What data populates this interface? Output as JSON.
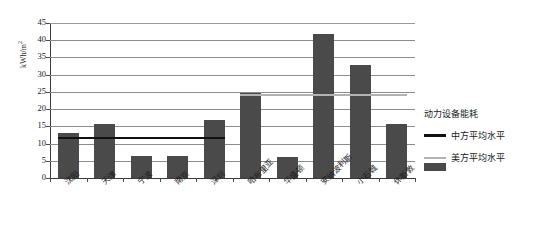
{
  "chart_data": {
    "type": "bar",
    "title": "",
    "xlabel": "",
    "ylabel": "kWh/m",
    "ylabel_sup": "2",
    "ylim": [
      0,
      45
    ],
    "ytick_step": 5,
    "yticks": [
      "45",
      "40",
      "35",
      "30",
      "25",
      "20",
      "15",
      "10",
      "5",
      "0"
    ],
    "grid": true,
    "categories": [
      "沈阳",
      "天津",
      "宁波",
      "南京",
      "深圳",
      "哈布里亚",
      "华盛顿",
      "安纳波利斯",
      "小石城",
      "休斯敦"
    ],
    "series": [
      {
        "name": "动力设备能耗",
        "type": "bar",
        "color": "#4a4a4a",
        "values": [
          13.0,
          15.7,
          6.5,
          6.3,
          16.8,
          24.8,
          6.0,
          41.8,
          32.8,
          15.7
        ]
      },
      {
        "name": "中方平均水平",
        "type": "line",
        "color": "#111111",
        "value": 12.0,
        "span_categories": [
          0,
          4
        ]
      },
      {
        "name": "美方平均水平",
        "type": "line",
        "color": "#b3b3b3",
        "value": 24.5,
        "span_categories": [
          5,
          9
        ]
      }
    ],
    "legend": {
      "position": "right",
      "entries": [
        {
          "label": "动力设备能耗",
          "marker": "bar-swatch",
          "color": "#4a4a4a"
        },
        {
          "label": "中方平均水平",
          "marker": "line-swatch",
          "color": "#111111"
        },
        {
          "label": "美方平均水平",
          "marker": "line-swatch",
          "color": "#b3b3b3"
        }
      ]
    }
  }
}
